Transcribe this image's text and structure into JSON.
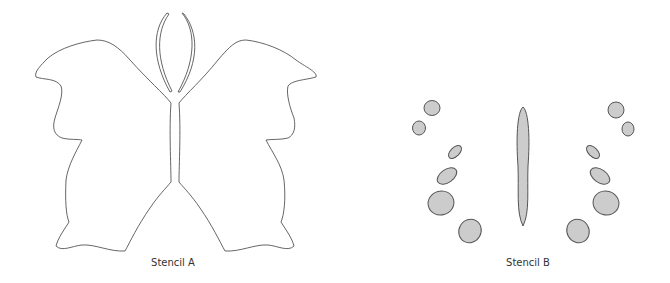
{
  "stencils": [
    {
      "id": "A",
      "label": "Stencil A",
      "type": "outline",
      "stroke_color": "#555555",
      "fill_color": "#ffffff"
    },
    {
      "id": "B",
      "label": "Stencil B",
      "type": "filled-spots",
      "stroke_color": "#555555",
      "fill_color": "#cccccc"
    }
  ]
}
